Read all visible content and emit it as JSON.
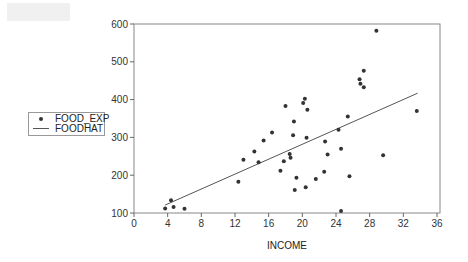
{
  "chart_data": {
    "type": "scatter",
    "title": "",
    "xlabel": "INCOME",
    "ylabel": "",
    "xlim": [
      0,
      36
    ],
    "ylim": [
      100,
      600
    ],
    "x_ticks": [
      0,
      4,
      8,
      12,
      16,
      20,
      24,
      28,
      32,
      36
    ],
    "y_ticks": [
      100,
      200,
      300,
      400,
      500,
      600
    ],
    "grid": false,
    "legend_position": "left",
    "series": [
      {
        "name": "FOOD_EXP",
        "style": "markers",
        "color": "#333333",
        "points": [
          [
            3.7,
            112
          ],
          [
            4.4,
            134
          ],
          [
            4.7,
            116
          ],
          [
            6.0,
            111
          ],
          [
            12.4,
            183
          ],
          [
            13.0,
            241
          ],
          [
            14.3,
            263
          ],
          [
            14.8,
            234
          ],
          [
            15.4,
            292
          ],
          [
            16.4,
            313
          ],
          [
            17.4,
            212
          ],
          [
            17.8,
            237
          ],
          [
            18.0,
            383
          ],
          [
            18.5,
            256
          ],
          [
            18.6,
            246
          ],
          [
            18.9,
            306
          ],
          [
            19.0,
            342
          ],
          [
            19.1,
            161
          ],
          [
            19.3,
            193
          ],
          [
            20.1,
            391
          ],
          [
            20.3,
            402
          ],
          [
            20.4,
            168
          ],
          [
            20.5,
            299
          ],
          [
            20.6,
            373
          ],
          [
            21.6,
            190
          ],
          [
            22.6,
            209
          ],
          [
            22.7,
            289
          ],
          [
            23.0,
            255
          ],
          [
            24.3,
            320
          ],
          [
            24.6,
            270
          ],
          [
            24.6,
            105
          ],
          [
            25.4,
            355
          ],
          [
            25.6,
            197
          ],
          [
            26.8,
            454
          ],
          [
            26.9,
            442
          ],
          [
            27.3,
            476
          ],
          [
            27.3,
            433
          ],
          [
            28.8,
            582
          ],
          [
            29.6,
            253
          ],
          [
            33.6,
            370
          ]
        ]
      },
      {
        "name": "FOODHAT",
        "style": "line",
        "color": "#555555",
        "points": [
          [
            3.7,
            121
          ],
          [
            33.7,
            417
          ]
        ]
      }
    ]
  },
  "legend": {
    "items": [
      {
        "label": "FOOD_EXP",
        "symbol": "dot"
      },
      {
        "label": "FOODHAT",
        "symbol": "line"
      }
    ]
  },
  "colors": {
    "axis": "#666666",
    "frame": "#888888",
    "marker": "#333333",
    "fit_line": "#555555",
    "tag_box": "#f0f0f0"
  }
}
